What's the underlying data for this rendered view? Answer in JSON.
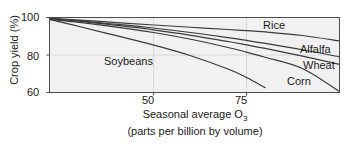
{
  "chart_data": {
    "type": "line",
    "title": "",
    "xlabel": "Seasonal average O3 (parts per billion by volume)",
    "xlabel_line1": "Seasonal average O",
    "xlabel_sub": "3",
    "xlabel_line2": "(parts per billion by volume)",
    "ylabel": "Crop yield (%)",
    "xlim": [
      22,
      100
    ],
    "ylim": [
      60,
      100
    ],
    "xticks": [
      50,
      75
    ],
    "xtick_labels": [
      "50",
      "75"
    ],
    "yticks": [
      60,
      80,
      100
    ],
    "ytick_labels": [
      "60",
      "80",
      "100"
    ],
    "grid": true,
    "grid_color": "#d8d8d8",
    "plot_bg": "#f1f1f1",
    "axis_color": "#4d4d4d",
    "line_color": "#3a3a3a",
    "legend_position": "inline-curve-labels",
    "series": [
      {
        "name": "Rice",
        "label": "Rice",
        "x": [
          22,
          30,
          40,
          50,
          60,
          70,
          75,
          80,
          90,
          100
        ],
        "values": [
          99.5,
          98.6,
          97.3,
          96.0,
          94.8,
          93.6,
          93.0,
          92.3,
          90.4,
          87.5
        ]
      },
      {
        "name": "Alfalfa",
        "label": "Alfalfa",
        "x": [
          22,
          30,
          40,
          50,
          60,
          70,
          75,
          80,
          90,
          100
        ],
        "values": [
          99.5,
          98.2,
          96.4,
          94.4,
          92.0,
          89.3,
          87.8,
          86.2,
          82.8,
          79.0
        ]
      },
      {
        "name": "Wheat",
        "label": "Wheat",
        "x": [
          22,
          30,
          40,
          50,
          60,
          70,
          75,
          80,
          90,
          100
        ],
        "values": [
          99.5,
          98.0,
          95.8,
          93.4,
          90.5,
          87.2,
          85.4,
          83.5,
          79.4,
          75.0
        ]
      },
      {
        "name": "Corn",
        "label": "Corn",
        "x": [
          22,
          30,
          40,
          50,
          60,
          70,
          75,
          80,
          90,
          100
        ],
        "values": [
          99.0,
          97.4,
          94.9,
          92.0,
          88.4,
          84.0,
          81.5,
          78.8,
          72.8,
          60.5
        ]
      },
      {
        "name": "Soybeans",
        "label": "Soybeans",
        "x": [
          22,
          30,
          40,
          50,
          60,
          70,
          75,
          80
        ],
        "values": [
          99.0,
          95.2,
          90.3,
          85.3,
          79.6,
          72.5,
          68.0,
          62.6
        ]
      }
    ]
  },
  "axis": {
    "y_title": "Crop yield (%)",
    "ytick_100": "100",
    "ytick_80": "80",
    "ytick_60": "60",
    "xtick_50": "50",
    "xtick_75": "75",
    "x_title_line1": "Seasonal average O",
    "x_title_sub": "3",
    "x_title_line2": "(parts per billion by volume)"
  },
  "labels": {
    "rice": "Rice",
    "alfalfa": "Alfalfa",
    "wheat": "Wheat",
    "corn": "Corn",
    "soybeans": "Soybeans"
  }
}
